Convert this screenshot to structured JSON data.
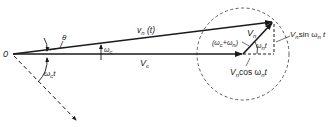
{
  "diagram": {
    "labels": {
      "origin": "0",
      "theta": "θ",
      "omega_c_sym": "ω",
      "omega_c_sub": "c",
      "omega_c_t_sym": "ω",
      "omega_c_t_sub": "c",
      "omega_c_t_t": "t",
      "vn_t_main": "v",
      "vn_t_sub": "n",
      "vn_t_arg": " (t)",
      "Vc_main": "V",
      "Vc_sub": "c",
      "Vn_main": "V",
      "Vn_sub": "n",
      "sum_freq": "(ω",
      "sum_freq_sub1": "c",
      "sum_freq_plus": "+ω",
      "sum_freq_sub2": "n",
      "sum_freq_close": ")",
      "wn_t_sym": "ω",
      "wn_t_sub": "n",
      "wn_t_t": "t",
      "sin_V": "V",
      "sin_Vsub": "n",
      "sin_text": "sin ω",
      "sin_wsub": "n",
      "sin_t": " t",
      "cos_V": "V",
      "cos_Vsub": "n",
      "cos_text": "cos ω",
      "cos_wsub": "n",
      "cos_t": "t"
    },
    "colors": {
      "line": "#1a1a1a",
      "text": "#222222",
      "background": "#ffffff"
    }
  }
}
